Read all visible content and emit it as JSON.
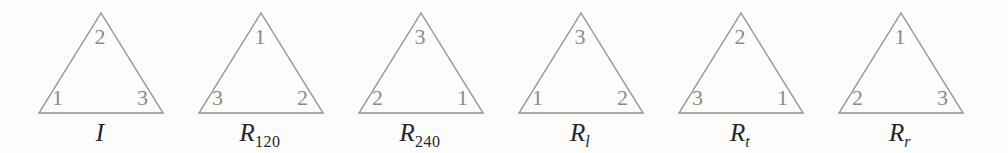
{
  "page": {
    "background": "#fcfcfa"
  },
  "colors": {
    "triangle_stroke": "#8f8f8f",
    "vertex_label": "#8a8a8a",
    "caption_text": "#262626"
  },
  "figures": [
    {
      "name": "identity",
      "vertices": {
        "top": "2",
        "left": "1",
        "right": "3"
      },
      "caption": {
        "base": "I",
        "sub": ""
      }
    },
    {
      "name": "rotation-120",
      "vertices": {
        "top": "1",
        "left": "3",
        "right": "2"
      },
      "caption": {
        "base": "R",
        "sub": "120"
      }
    },
    {
      "name": "rotation-240",
      "vertices": {
        "top": "3",
        "left": "2",
        "right": "1"
      },
      "caption": {
        "base": "R",
        "sub": "240"
      }
    },
    {
      "name": "reflection-l",
      "vertices": {
        "top": "3",
        "left": "1",
        "right": "2"
      },
      "caption": {
        "base": "R",
        "sub": "l"
      }
    },
    {
      "name": "reflection-t",
      "vertices": {
        "top": "2",
        "left": "3",
        "right": "1"
      },
      "caption": {
        "base": "R",
        "sub": "t"
      }
    },
    {
      "name": "reflection-r",
      "vertices": {
        "top": "1",
        "left": "2",
        "right": "3"
      },
      "caption": {
        "base": "R",
        "sub": "r"
      }
    }
  ]
}
